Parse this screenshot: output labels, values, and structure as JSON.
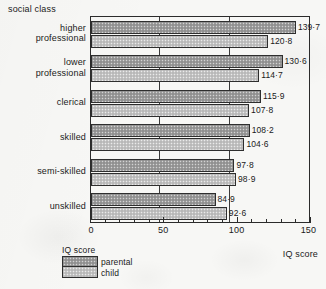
{
  "chart_data": {
    "type": "bar",
    "orientation": "horizontal",
    "title": "",
    "xlabel": "IQ score",
    "ylabel": "social class",
    "xlim": [
      0,
      150
    ],
    "xticks": [
      0,
      50,
      100,
      150
    ],
    "xtick_labels": [
      "0",
      "50",
      "100",
      "150"
    ],
    "minor_tick_step": 10,
    "grid": "vertical gridlines at 50 and 100",
    "legend_position": "below plot, left",
    "legend_title": "IQ score",
    "categories": [
      "higher\nprofessional",
      "lower\nprofessional",
      "clerical",
      "skilled",
      "semi-skilled",
      "unskilled"
    ],
    "series": [
      {
        "name": "parental",
        "values": [
          139.7,
          130.6,
          115.9,
          108.2,
          97.8,
          84.9
        ],
        "labels": [
          "139·7",
          "130·6",
          "115·9",
          "108·2",
          "97·8",
          "84·9"
        ],
        "color": "#9d9d9d"
      },
      {
        "name": "child",
        "values": [
          120.8,
          114.7,
          107.8,
          104.6,
          98.9,
          92.6
        ],
        "labels": [
          "120·8",
          "114·7",
          "107·8",
          "104·6",
          "98·9",
          "92·6"
        ],
        "color": "#c4c4c4"
      }
    ]
  },
  "labels": {
    "social_class": "social class",
    "iq_score_axis": "IQ score"
  },
  "legend": {
    "title": "IQ score",
    "entries": [
      {
        "label": "parental"
      },
      {
        "label": "child"
      }
    ]
  },
  "colors": {
    "background": "#f7f7f5",
    "frame": "#2b2b2b",
    "parental_fill": "#9d9d9d",
    "child_fill": "#c4c4c4",
    "text": "#1a1a1a"
  }
}
